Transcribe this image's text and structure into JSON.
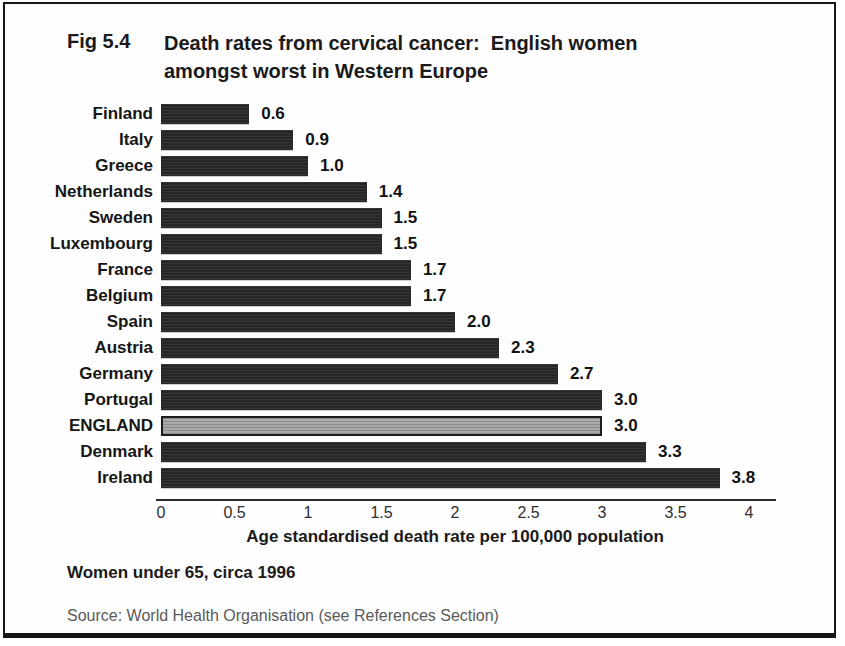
{
  "header": {
    "fig_number": "Fig 5.4",
    "title_lines": {
      "0": "Death rates from cervical cancer:  English women",
      "1": "amongst worst in Western Europe"
    }
  },
  "chart_data": {
    "type": "bar",
    "orientation": "horizontal",
    "title": "Death rates from cervical cancer: English women amongst worst in Western Europe",
    "categories": [
      "Finland",
      "Italy",
      "Greece",
      "Netherlands",
      "Sweden",
      "Luxembourg",
      "France",
      "Belgium",
      "Spain",
      "Austria",
      "Germany",
      "Portugal",
      "ENGLAND",
      "Denmark",
      "Ireland"
    ],
    "values": [
      0.6,
      0.9,
      1.0,
      1.4,
      1.5,
      1.5,
      1.7,
      1.7,
      2.0,
      2.3,
      2.7,
      3.0,
      3.0,
      3.3,
      3.8
    ],
    "value_labels": [
      "0.6",
      "0.9",
      "1.0",
      "1.4",
      "1.5",
      "1.5",
      "1.7",
      "1.7",
      "2.0",
      "2.3",
      "2.7",
      "3.0",
      "3.0",
      "3.3",
      "3.8"
    ],
    "highlight_category": "ENGLAND",
    "xlabel": "Age standardised death rate per 100,000 population",
    "xlim": [
      0,
      4
    ],
    "xticks": [
      "0",
      "0.5",
      "1",
      "1.5",
      "2",
      "2.5",
      "3",
      "3.5",
      "4"
    ],
    "grid": "off",
    "legend": "none",
    "bar_color": "#262626",
    "highlight_color": "#9e9e9e"
  },
  "footnote": "Women under 65, circa 1996",
  "source": "Source: World Health Organisation (see References Section)"
}
